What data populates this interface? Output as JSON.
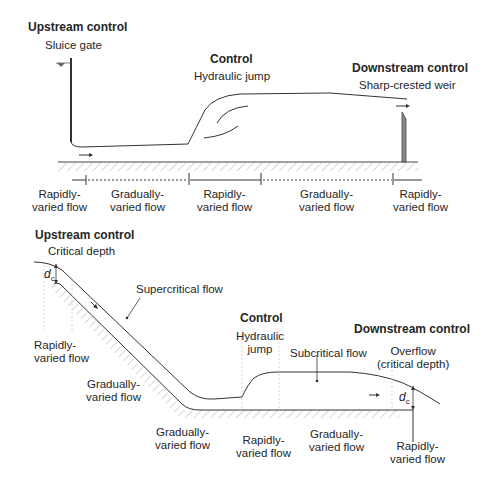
{
  "top_diagram": {
    "upstream": {
      "title": "Upstream control",
      "subtitle": "Sluice gate"
    },
    "control": {
      "title": "Control",
      "subtitle": "Hydraulic jump"
    },
    "downstream": {
      "title": "Downstream control",
      "subtitle": "Sharp-crested weir"
    },
    "regions": [
      {
        "line1": "Rapidly-",
        "line2": "varied flow"
      },
      {
        "line1": "Gradually-",
        "line2": "varied flow"
      },
      {
        "line1": "Rapidly-",
        "line2": "varied flow"
      },
      {
        "line1": "Gradually-",
        "line2": "varied flow"
      },
      {
        "line1": "Rapidly-",
        "line2": "varied flow"
      }
    ]
  },
  "bottom_diagram": {
    "upstream": {
      "title": "Upstream control",
      "subtitle": "Critical depth"
    },
    "control": {
      "title": "Control",
      "subtitle_line1": "Hydraulic",
      "subtitle_line2": "jump"
    },
    "downstream": {
      "title": "Downstream control",
      "subtitle_line1": "Overflow",
      "subtitle_line2": "(critical depth)"
    },
    "supercritical": "Supercritical flow",
    "subcritical": "Subcritical flow",
    "dc_symbol": "d",
    "dc_sub": "c",
    "regions": [
      {
        "line1": "Rapidly-",
        "line2": "varied flow"
      },
      {
        "line1": "Gradually-",
        "line2": "varied flow"
      },
      {
        "line1": "Gradually-",
        "line2": "varied flow"
      },
      {
        "line1": "Rapidly-",
        "line2": "varied flow"
      },
      {
        "line1": "Gradually-",
        "line2": "varied flow"
      },
      {
        "line1": "Rapidly-",
        "line2": "varied flow"
      }
    ]
  }
}
